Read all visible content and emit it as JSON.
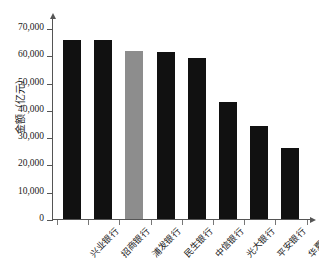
{
  "chart_data": {
    "type": "bar",
    "title": "",
    "xlabel": "",
    "ylabel": "金额（亿元）",
    "categories": [
      "兴业银行",
      "招商银行",
      "浦发银行",
      "民生银行",
      "中信银行",
      "光大银行",
      "平安银行",
      "华夏银行"
    ],
    "values": [
      65700,
      65500,
      61500,
      61200,
      59000,
      43000,
      34000,
      26000
    ],
    "bar_colors": [
      "#111111",
      "#111111",
      "#8d8d8d",
      "#111111",
      "#111111",
      "#111111",
      "#111111",
      "#111111"
    ],
    "ylim": [
      0,
      74000
    ],
    "ytick_values": [
      0,
      10000,
      20000,
      30000,
      40000,
      50000,
      60000,
      70000
    ],
    "ytick_labels": [
      "0",
      "10,000",
      "20,000",
      "30,000",
      "40,000",
      "50,000",
      "60,000",
      "70,000"
    ],
    "grid": false,
    "legend": null,
    "axis_color": "#555555"
  },
  "axes": {
    "y_axis_title": "金额（亿元）"
  }
}
